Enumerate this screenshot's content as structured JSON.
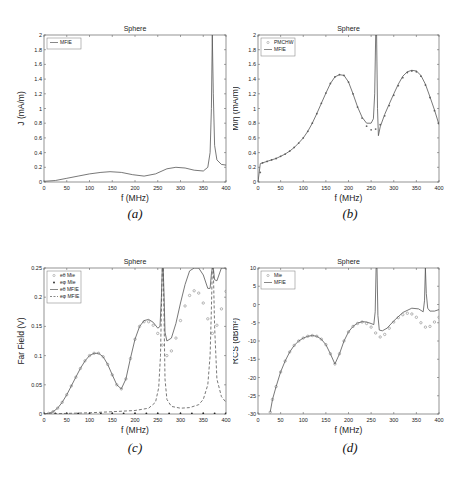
{
  "captions": [
    "(a)",
    "(b)",
    "(c)",
    "(d)"
  ],
  "chart_data": [
    {
      "id": "a",
      "type": "line",
      "title": "Sphere",
      "xlabel": "f (MHz)",
      "ylabel": "J (mA/m)",
      "xlim": [
        0,
        400
      ],
      "ylim": [
        0,
        2
      ],
      "xticks": [
        0,
        50,
        100,
        150,
        200,
        250,
        300,
        350,
        400
      ],
      "yticks": [
        0,
        0.2,
        0.4,
        0.6,
        0.8,
        1,
        1.2,
        1.4,
        1.6,
        1.8,
        2
      ],
      "legend": [
        "MFIE"
      ],
      "legend_position": "upper left",
      "series": [
        {
          "name": "MFIE",
          "style": "solid",
          "x": [
            0,
            25,
            50,
            75,
            100,
            125,
            145,
            170,
            195,
            220,
            245,
            270,
            290,
            310,
            330,
            350,
            360,
            365,
            368,
            370,
            372,
            375,
            380,
            390,
            400
          ],
          "y": [
            0.01,
            0.02,
            0.05,
            0.08,
            0.11,
            0.13,
            0.14,
            0.13,
            0.1,
            0.08,
            0.11,
            0.18,
            0.2,
            0.19,
            0.16,
            0.15,
            0.2,
            0.4,
            1.0,
            2.0,
            1.2,
            0.5,
            0.3,
            0.24,
            0.23
          ]
        }
      ]
    },
    {
      "id": "b",
      "type": "line",
      "title": "Sphere",
      "xlabel": "f (MHz)",
      "ylabel": "M/η (mA/m)",
      "xlim": [
        0,
        400
      ],
      "ylim": [
        0,
        2
      ],
      "xticks": [
        0,
        50,
        100,
        150,
        200,
        250,
        300,
        350,
        400
      ],
      "yticks": [
        0,
        0.2,
        0.4,
        0.6,
        0.8,
        1,
        1.2,
        1.4,
        1.6,
        1.8,
        2
      ],
      "legend": [
        "PMCHW",
        "MFIE"
      ],
      "legend_position": "upper left",
      "series": [
        {
          "name": "PMCHW",
          "style": "markers",
          "x": [
            5,
            10,
            20,
            30,
            40,
            50,
            60,
            70,
            80,
            90,
            100,
            110,
            120,
            130,
            140,
            150,
            160,
            170,
            180,
            190,
            200,
            210,
            220,
            230,
            240,
            250,
            260,
            270,
            280,
            290,
            300,
            310,
            320,
            330,
            340,
            350,
            360,
            370,
            380,
            390,
            400
          ],
          "y": [
            0.13,
            0.26,
            0.28,
            0.3,
            0.32,
            0.35,
            0.38,
            0.42,
            0.47,
            0.53,
            0.6,
            0.69,
            0.8,
            0.93,
            1.07,
            1.21,
            1.34,
            1.43,
            1.46,
            1.45,
            1.36,
            1.2,
            1.02,
            0.87,
            0.76,
            0.71,
            0.72,
            0.78,
            0.9,
            1.04,
            1.18,
            1.31,
            1.42,
            1.49,
            1.51,
            1.5,
            1.44,
            1.32,
            1.15,
            0.97,
            0.8
          ]
        },
        {
          "name": "MFIE",
          "style": "solid",
          "x": [
            0,
            5,
            10,
            20,
            30,
            40,
            50,
            60,
            70,
            80,
            90,
            100,
            110,
            120,
            130,
            140,
            150,
            160,
            170,
            180,
            190,
            200,
            210,
            220,
            230,
            240,
            250,
            255,
            258,
            260,
            262,
            264,
            266,
            270,
            280,
            290,
            300,
            310,
            320,
            330,
            340,
            350,
            360,
            370,
            380,
            390,
            400
          ],
          "y": [
            0.0,
            0.25,
            0.26,
            0.28,
            0.3,
            0.32,
            0.35,
            0.38,
            0.42,
            0.47,
            0.53,
            0.6,
            0.69,
            0.8,
            0.93,
            1.07,
            1.21,
            1.34,
            1.43,
            1.46,
            1.45,
            1.36,
            1.2,
            1.02,
            0.88,
            0.8,
            0.8,
            0.86,
            1.2,
            2.0,
            2.0,
            1.0,
            0.63,
            0.75,
            0.92,
            1.06,
            1.2,
            1.33,
            1.44,
            1.5,
            1.52,
            1.51,
            1.45,
            1.33,
            1.16,
            0.98,
            0.78
          ]
        }
      ]
    },
    {
      "id": "c",
      "type": "line",
      "title": "Sphere",
      "xlabel": "f (MHz)",
      "ylabel": "Far Field (V)",
      "xlim": [
        0,
        400
      ],
      "ylim": [
        0,
        0.25
      ],
      "xticks": [
        0,
        50,
        100,
        150,
        200,
        250,
        300,
        350,
        400
      ],
      "yticks": [
        0,
        0.05,
        0.1,
        0.15,
        0.2,
        0.25
      ],
      "legend": [
        "eθ Mie",
        "eφ Mie",
        "eθ MFIE",
        "eφ MFIE"
      ],
      "legend_position": "upper left",
      "series": [
        {
          "name": "eθ Mie",
          "style": "open-markers",
          "x": [
            10,
            20,
            30,
            40,
            50,
            60,
            70,
            80,
            90,
            100,
            110,
            120,
            130,
            140,
            150,
            160,
            170,
            180,
            190,
            200,
            210,
            220,
            230,
            240,
            250,
            260,
            270,
            280,
            290,
            300,
            310,
            320,
            330,
            340,
            350,
            360,
            370,
            380,
            390,
            400
          ],
          "y": [
            0.001,
            0.004,
            0.01,
            0.02,
            0.033,
            0.048,
            0.063,
            0.078,
            0.091,
            0.1,
            0.104,
            0.104,
            0.098,
            0.085,
            0.067,
            0.05,
            0.043,
            0.06,
            0.095,
            0.128,
            0.15,
            0.158,
            0.158,
            0.152,
            0.138,
            0.118,
            0.1,
            0.108,
            0.13,
            0.16,
            0.185,
            0.203,
            0.211,
            0.207,
            0.19,
            0.163,
            0.138,
            0.152,
            0.18,
            0.21
          ]
        },
        {
          "name": "eφ Mie",
          "style": "filled-markers",
          "x": [
            0,
            25,
            50,
            75,
            100,
            125,
            150,
            175,
            200,
            225,
            250,
            275,
            300,
            325,
            350,
            375,
            400
          ],
          "y": [
            0,
            0,
            0,
            0,
            0,
            0,
            0,
            0,
            0,
            0,
            0,
            0,
            0,
            0,
            0,
            0,
            0
          ]
        },
        {
          "name": "eθ MFIE",
          "style": "solid",
          "x": [
            0,
            10,
            20,
            30,
            40,
            50,
            60,
            70,
            80,
            90,
            100,
            110,
            120,
            130,
            140,
            150,
            160,
            170,
            180,
            190,
            200,
            210,
            220,
            230,
            240,
            250,
            255,
            258,
            260,
            262,
            264,
            266,
            270,
            280,
            290,
            300,
            310,
            320,
            330,
            340,
            350,
            360,
            365,
            368,
            370,
            372,
            375,
            380,
            390,
            400
          ],
          "y": [
            0,
            0.001,
            0.004,
            0.01,
            0.02,
            0.033,
            0.048,
            0.063,
            0.078,
            0.091,
            0.1,
            0.104,
            0.104,
            0.098,
            0.085,
            0.067,
            0.05,
            0.043,
            0.06,
            0.095,
            0.128,
            0.15,
            0.16,
            0.162,
            0.157,
            0.147,
            0.15,
            0.2,
            0.25,
            0.25,
            0.2,
            0.14,
            0.125,
            0.13,
            0.155,
            0.19,
            0.222,
            0.245,
            0.25,
            0.25,
            0.238,
            0.215,
            0.215,
            0.24,
            0.25,
            0.25,
            0.23,
            0.228,
            0.25,
            0.25
          ]
        },
        {
          "name": "eφ MFIE",
          "style": "dashed",
          "x": [
            0,
            50,
            100,
            150,
            200,
            230,
            245,
            252,
            256,
            258,
            260,
            262,
            264,
            266,
            270,
            280,
            300,
            320,
            340,
            350,
            360,
            365,
            368,
            370,
            372,
            375,
            380,
            390,
            400
          ],
          "y": [
            0,
            0.001,
            0.002,
            0.004,
            0.006,
            0.01,
            0.02,
            0.045,
            0.1,
            0.18,
            0.25,
            0.25,
            0.16,
            0.06,
            0.025,
            0.013,
            0.01,
            0.011,
            0.016,
            0.025,
            0.05,
            0.1,
            0.18,
            0.25,
            0.25,
            0.15,
            0.06,
            0.03,
            0.02
          ]
        }
      ]
    },
    {
      "id": "d",
      "type": "line",
      "title": "Sphere",
      "xlabel": "f (MHz)",
      "ylabel": "RCS (dBm²)",
      "xlim": [
        0,
        400
      ],
      "ylim": [
        -30,
        10
      ],
      "xticks": [
        0,
        50,
        100,
        150,
        200,
        250,
        300,
        350,
        400
      ],
      "yticks": [
        -30,
        -25,
        -20,
        -15,
        -10,
        -5,
        0,
        5,
        10
      ],
      "legend": [
        "Mie",
        "MFIE"
      ],
      "legend_position": "upper left",
      "series": [
        {
          "name": "Mie",
          "style": "open-markers",
          "x": [
            27,
            32,
            40,
            50,
            60,
            70,
            80,
            90,
            100,
            110,
            120,
            130,
            140,
            150,
            160,
            170,
            180,
            190,
            200,
            210,
            220,
            230,
            240,
            250,
            260,
            270,
            280,
            290,
            300,
            310,
            320,
            330,
            340,
            350,
            360,
            370,
            380,
            390,
            400
          ],
          "y": [
            -29.5,
            -26,
            -22.5,
            -18.5,
            -15.5,
            -13,
            -11.2,
            -10,
            -9.2,
            -8.7,
            -8.5,
            -8.7,
            -9.5,
            -11,
            -13.5,
            -16.3,
            -13.5,
            -10,
            -7.5,
            -6,
            -5.2,
            -4.8,
            -5.2,
            -6.2,
            -7.8,
            -8.9,
            -8.2,
            -6.5,
            -4.8,
            -3.6,
            -2.8,
            -2.4,
            -2.6,
            -3.5,
            -5,
            -6.2,
            -6,
            -4.8,
            -3.5
          ]
        },
        {
          "name": "MFIE",
          "style": "solid",
          "x": [
            27,
            32,
            40,
            50,
            60,
            70,
            80,
            90,
            100,
            110,
            120,
            130,
            140,
            150,
            160,
            170,
            180,
            190,
            200,
            210,
            220,
            230,
            240,
            250,
            256,
            259,
            261,
            263,
            265,
            268,
            275,
            285,
            300,
            320,
            340,
            355,
            365,
            368,
            370,
            372,
            375,
            380,
            390,
            400
          ],
          "y": [
            -29.5,
            -26,
            -22.5,
            -18.5,
            -15.5,
            -13,
            -11.2,
            -10,
            -9.2,
            -8.7,
            -8.5,
            -8.7,
            -9.5,
            -11,
            -13.5,
            -16.3,
            -13.5,
            -10,
            -7.5,
            -6,
            -5.1,
            -4.7,
            -4.8,
            -5.2,
            -5.5,
            -2,
            10,
            10,
            -3,
            -7.0,
            -7.2,
            -6.5,
            -4.5,
            -2.2,
            -1.0,
            -1.2,
            -2.0,
            1,
            10,
            3,
            -1,
            -1.8,
            -1.8,
            -1.4
          ]
        }
      ]
    }
  ]
}
